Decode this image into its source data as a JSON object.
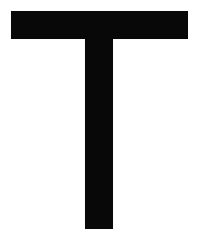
{
  "image": {
    "kind": "letterform-glyph",
    "character": "T",
    "character_name": "Latin Capital Letter T",
    "description": "Large black sans-serif capital letter T on a plain white background",
    "width_px": 199,
    "height_px": 251,
    "background_color": "#ffffff",
    "glyph_color": "#080808",
    "style": "sans-serif, bold, no serifs, flat terminals"
  },
  "glyph": {
    "label": "T",
    "parts": [
      {
        "name": "crossbar",
        "shape": "rectangle",
        "x": 11,
        "y": 11,
        "width": 177,
        "height": 28,
        "color": "#080808"
      },
      {
        "name": "stem",
        "shape": "rectangle",
        "x": 85,
        "y": 38,
        "width": 28,
        "height": 191,
        "color": "#080808"
      }
    ]
  },
  "measurements": {
    "crossbar_left": 11,
    "crossbar_right": 188,
    "crossbar_top": 11,
    "crossbar_bottom": 39,
    "stem_left": 85,
    "stem_right": 113,
    "stem_bottom": 229,
    "stroke_width": 28,
    "glyph_total_height": 218,
    "glyph_total_width": 177
  }
}
